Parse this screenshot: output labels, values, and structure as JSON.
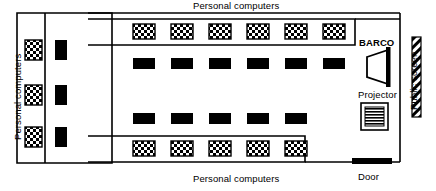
{
  "diagram": {
    "type": "floor-plan",
    "canvas": {
      "width": 436,
      "height": 191
    },
    "colors": {
      "ink": "#000000",
      "paper": "#ffffff"
    }
  },
  "labels": {
    "top_personal_computers": "Personal computers",
    "bottom_personal_computers": "Personal computers",
    "left_personal_computers": "Personal computers",
    "barco": "BARCO",
    "projector": "Projector",
    "public_screen": "Public screen",
    "door": "Door"
  },
  "equipment": {
    "keyboard_glyph_name": "checkered-keyboard-icon",
    "monitor_glyph_name": "black-monitor-icon",
    "projector_glyph_name": "striped-projector-icon",
    "barco_glyph_name": "barco-beamer-icon",
    "screen_glyph_name": "hatched-public-screen-icon",
    "door_glyph_name": "door-bar-icon"
  },
  "workstation_rows": [
    {
      "name": "left-column-keyboards",
      "kind": "keyboard",
      "orientation": "vertical",
      "count": 3,
      "x": 25,
      "ys": [
        40,
        85,
        127
      ],
      "w": 17,
      "h": 20
    },
    {
      "name": "left-column-monitors",
      "kind": "monitor",
      "orientation": "vertical",
      "count": 3,
      "x": 54,
      "ys": [
        40,
        85,
        127
      ],
      "w": 12,
      "h": 20
    },
    {
      "name": "top-row-keyboards",
      "kind": "keyboard",
      "orientation": "horizontal",
      "count": 6,
      "y": 24,
      "xs": [
        133,
        171,
        209,
        247,
        285,
        323
      ],
      "w": 22,
      "h": 15
    },
    {
      "name": "second-row-monitors",
      "kind": "monitor",
      "orientation": "horizontal",
      "count": 6,
      "y": 58,
      "xs": [
        133,
        171,
        209,
        247,
        285,
        323
      ],
      "w": 22,
      "h": 11
    },
    {
      "name": "third-row-monitors",
      "kind": "monitor",
      "orientation": "horizontal",
      "count": 5,
      "y": 113,
      "xs": [
        133,
        171,
        209,
        247,
        285
      ],
      "w": 22,
      "h": 11
    },
    {
      "name": "bottom-row-keyboards",
      "kind": "keyboard",
      "orientation": "horizontal",
      "count": 5,
      "y": 141,
      "xs": [
        133,
        171,
        209,
        247,
        285
      ],
      "w": 22,
      "h": 15
    }
  ],
  "counts": {
    "keyboards_total": 19,
    "monitors_total": 14
  }
}
